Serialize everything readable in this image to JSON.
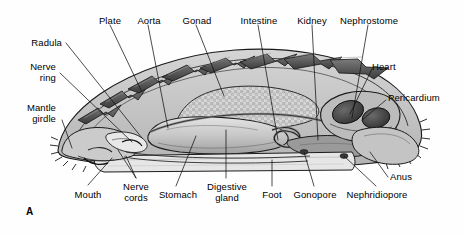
{
  "figure": {
    "panel_letter": "A",
    "organism": "Chiton sagittal section",
    "background_color": "#fefefe",
    "line_color": "#1a1a1a",
    "text_color": "#000000"
  },
  "labels": {
    "radula": "Radula",
    "nerve_ring": "Nerve\nring",
    "mantle_girdle": "Mantle\ngirdle",
    "plate": "Plate",
    "aorta": "Aorta",
    "gonad": "Gonad",
    "intestine": "Intestine",
    "kidney": "Kidney",
    "nephrostome": "Nephrostome",
    "heart": "Heart",
    "pericardium": "Pericardium",
    "anus": "Anus",
    "nephridiopore": "Nephridiopore",
    "gonopore": "Gonopore",
    "foot": "Foot",
    "digestive_gland": "Digestive\ngland",
    "stomach": "Stomach",
    "nerve_cords": "Nerve\ncords",
    "mouth": "Mouth"
  },
  "palette": {
    "shell_plate_dark": "#4a4a4a",
    "shell_plate_mid": "#6e6e6e",
    "mantle_fill": "#c9c9c9",
    "body_fill": "#d9d9d9",
    "foot_fill": "#e2e2e2",
    "gonad_fill": "#cfcfcf",
    "organ_fill": "#a8a8a8",
    "heart_dark": "#3d3d3d",
    "outline": "#1a1a1a"
  }
}
